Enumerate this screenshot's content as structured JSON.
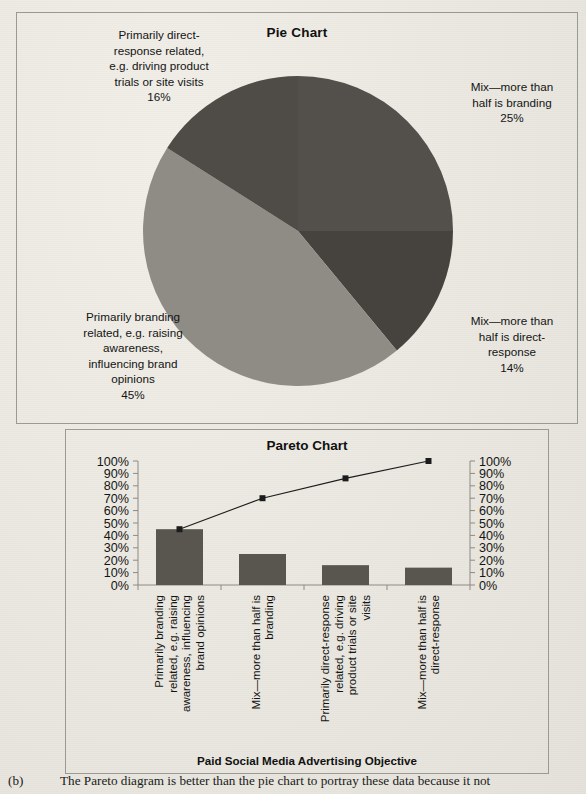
{
  "pie": {
    "title": "Pie Chart",
    "labels": {
      "direct": "Primarily direct-\nresponse related,\ne.g. driving product\ntrials or site visits\n16%",
      "mix_branding": "Mix—more than\nhalf is branding\n25%",
      "mix_direct": "Mix—more than\nhalf is direct-\nresponse\n14%",
      "branding": "Primarily branding\nrelated, e.g. raising\nawareness,\ninfluencing brand\nopinions\n45%"
    }
  },
  "pareto": {
    "title": "Pareto Chart",
    "xlabel": "Paid Social Media Advertising Objective"
  },
  "caption": {
    "marker": "(b)",
    "text": "The Pareto diagram is better than the pie chart to portray these data because it not"
  },
  "colors": {
    "slice_dark": "#53504b",
    "slice_light": "#8e8c85",
    "bar": "#59564f",
    "line": "#1c1c1c",
    "axis": "#8c8a83",
    "panel_border": "#9a9a92",
    "page_bg": "#eceae3"
  },
  "chart_data": [
    {
      "type": "pie",
      "title": "Pie Chart",
      "legend": "none",
      "start_angle_deg": 0,
      "direction": "clockwise",
      "categories": [
        "Mix—more than half is branding",
        "Mix—more than half is direct-response",
        "Primarily branding related, e.g. raising awareness, influencing brand opinions",
        "Primarily direct-response related, e.g. driving product trials or site visits"
      ],
      "values": [
        25,
        14,
        45,
        16
      ],
      "value_labels": [
        "25%",
        "14%",
        "45%",
        "16%"
      ],
      "slice_colors": [
        "#53504b",
        "#46433f",
        "#8e8c85",
        "#4f4c47"
      ]
    },
    {
      "type": "bar",
      "title": "Pareto Chart",
      "xlabel": "Paid Social Media Advertising Objective",
      "ylabel": "",
      "ylim": [
        0,
        100
      ],
      "y2lim": [
        0,
        100
      ],
      "grid": false,
      "categories": [
        "Primarily branding related, e.g. raising awareness, influencing brand opinions",
        "Mix—more than half is branding",
        "Primarily direct-response related, e.g. driving product trials or site visits",
        "Mix—more than half is direct-response"
      ],
      "category_label_rotation_deg": -90,
      "values": [
        45,
        25,
        16,
        14
      ],
      "series": [
        {
          "name": "Percentage",
          "type": "bar",
          "values": [
            45,
            25,
            16,
            14
          ]
        },
        {
          "name": "Cumulative percentage",
          "type": "line",
          "values": [
            45,
            70,
            86,
            100
          ]
        }
      ],
      "ytick_labels": [
        "0%",
        "10%",
        "20%",
        "30%",
        "40%",
        "50%",
        "60%",
        "70%",
        "80%",
        "90%",
        "100%"
      ],
      "ytick_values": [
        0,
        10,
        20,
        30,
        40,
        50,
        60,
        70,
        80,
        90,
        100
      ],
      "y2tick_labels": [
        "0%",
        "10%",
        "20%",
        "30%",
        "40%",
        "50%",
        "60%",
        "70%",
        "80%",
        "90%",
        "100%"
      ],
      "y2tick_values": [
        0,
        10,
        20,
        30,
        40,
        50,
        60,
        70,
        80,
        90,
        100
      ]
    }
  ]
}
